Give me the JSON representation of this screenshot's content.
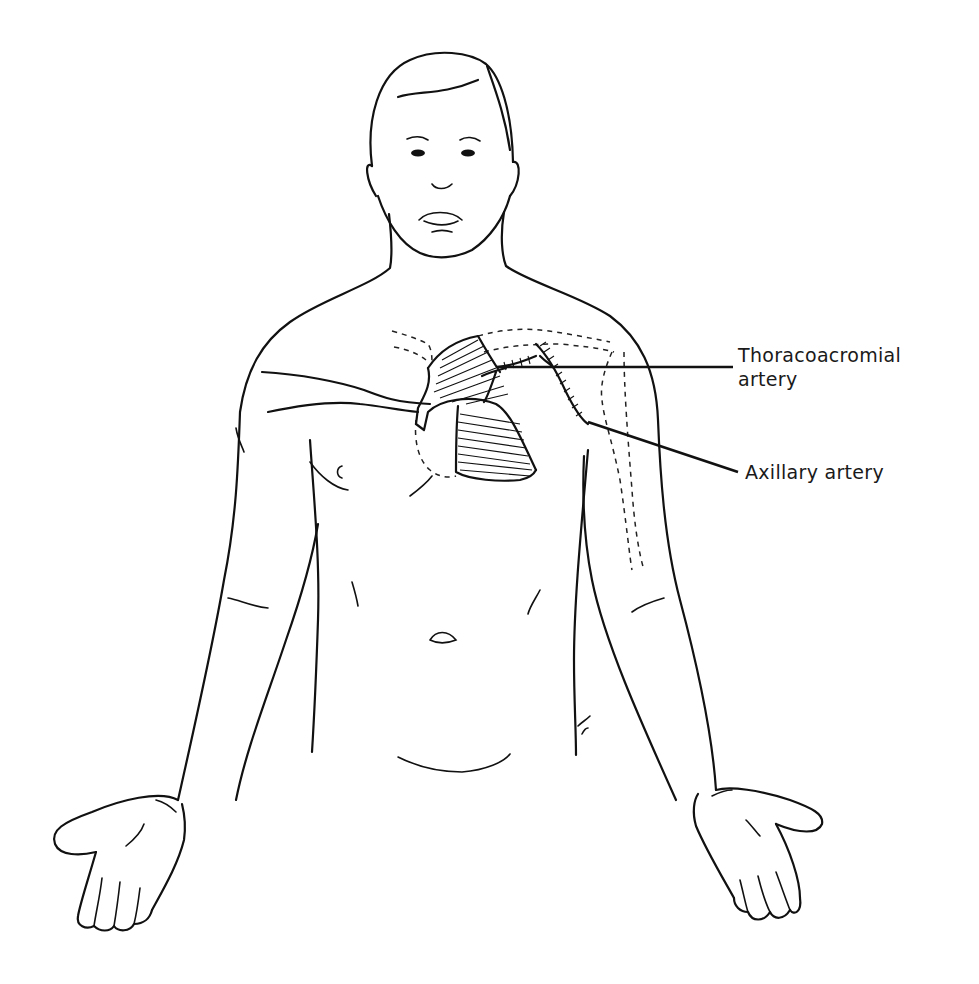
{
  "figure": {
    "type": "anatomical line drawing",
    "ink_color": "#111111",
    "background": "#ffffff"
  },
  "labels": [
    {
      "id": "thoracoacromial",
      "text": "Thoracoacromial\nartery",
      "x": 738,
      "y": 343
    },
    {
      "id": "axillary",
      "text": "Axillary artery",
      "x": 745,
      "y": 466
    }
  ],
  "leaders": [
    {
      "id": "thoracoacromial",
      "from": [
        497,
        367
      ],
      "to": [
        733,
        367
      ]
    },
    {
      "id": "axillary",
      "from": [
        588,
        422
      ],
      "to": [
        738,
        472
      ]
    }
  ]
}
